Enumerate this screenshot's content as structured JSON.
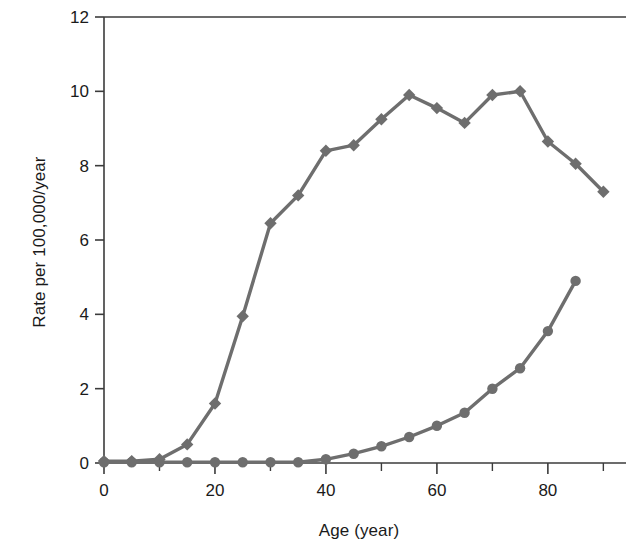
{
  "chart_data": {
    "type": "line",
    "title": "",
    "subtitle": "",
    "xlabel": "Age (year)",
    "ylabel": "Rate per 100,000/year",
    "x": [
      0,
      5,
      10,
      15,
      20,
      25,
      30,
      35,
      40,
      45,
      50,
      55,
      60,
      65,
      70,
      75,
      80,
      85,
      90
    ],
    "xlim": [
      0,
      93
    ],
    "ylim": [
      0,
      12
    ],
    "xticks": [
      0,
      20,
      40,
      60,
      80
    ],
    "xticklabels": [
      "0",
      "20",
      "40",
      "60",
      "80"
    ],
    "xminorticks": [
      10,
      30,
      50,
      70,
      90
    ],
    "yticks": [
      0,
      2,
      4,
      6,
      8,
      10,
      12
    ],
    "yticklabels": [
      "0",
      "2",
      "4",
      "6",
      "8",
      "10",
      "12"
    ],
    "grid": false,
    "legend": "none",
    "series": [
      {
        "name": "series-diamond",
        "marker": "diamond",
        "color": "#6e6e6e",
        "values": [
          0.05,
          0.05,
          0.1,
          0.5,
          1.6,
          3.95,
          6.45,
          7.2,
          8.4,
          8.55,
          9.25,
          9.9,
          9.55,
          9.15,
          9.9,
          10.0,
          8.65,
          8.05,
          7.3
        ]
      },
      {
        "name": "series-circle",
        "marker": "circle",
        "color": "#6e6e6e",
        "values": [
          0.02,
          0.02,
          0.02,
          0.02,
          0.02,
          0.02,
          0.02,
          0.02,
          0.1,
          0.25,
          0.45,
          0.7,
          1.0,
          1.35,
          2.0,
          2.55,
          3.55,
          4.9,
          null
        ]
      }
    ],
    "colors": {
      "line": "#6e6e6e",
      "marker": "#6e6e6e",
      "axis": "#3b3b3b",
      "text": "#1a1a1a",
      "background": "#ffffff"
    }
  }
}
